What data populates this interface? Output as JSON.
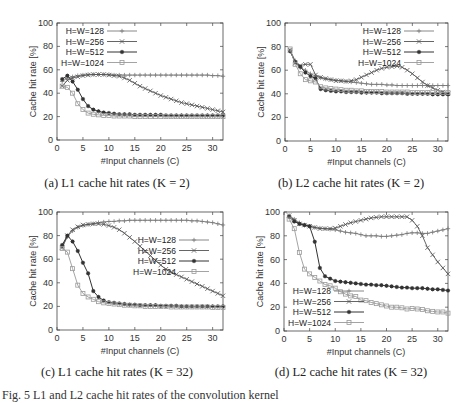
{
  "figure": {
    "bottom_caption": "Fig. 5 L1 and L2 cache hit rates of the convolution kernel"
  },
  "chart_data": [
    {
      "id": "a",
      "type": "line",
      "caption": "(a) L1 cache hit rates (K = 2)",
      "title": "",
      "xlabel": "#Input channels (C)",
      "ylabel": "Cache hit rate [%]",
      "xlim": [
        0,
        32
      ],
      "ylim": [
        0,
        100
      ],
      "xticks": [
        0,
        5,
        10,
        15,
        20,
        25,
        30
      ],
      "yticks": [
        0,
        20,
        40,
        60,
        80,
        100
      ],
      "legend_position": "top-left",
      "x": [
        1,
        2,
        3,
        4,
        5,
        6,
        7,
        8,
        9,
        10,
        11,
        12,
        13,
        14,
        15,
        16,
        17,
        18,
        19,
        20,
        21,
        22,
        23,
        24,
        25,
        26,
        27,
        28,
        29,
        30,
        31,
        32
      ],
      "series": [
        {
          "name": "H=W=128",
          "marker": "plus",
          "values": [
            50,
            53,
            54,
            55,
            55.5,
            56,
            56,
            56,
            56,
            56,
            55.5,
            55.5,
            55.5,
            55.5,
            55.5,
            55.5,
            55.5,
            55.5,
            55.5,
            55.5,
            55.5,
            55.5,
            55.5,
            55.5,
            55.5,
            55.5,
            55.5,
            55.5,
            55.5,
            55,
            55,
            54.5
          ]
        },
        {
          "name": "H=W=256",
          "marker": "x",
          "values": [
            46,
            51,
            53,
            54,
            55,
            55.5,
            56,
            56,
            56,
            55.5,
            55,
            54.5,
            53,
            51,
            48.5,
            46,
            44,
            42,
            40,
            38,
            36.5,
            35,
            33.5,
            32,
            31,
            30,
            29,
            28,
            27,
            26,
            25,
            24
          ]
        },
        {
          "name": "H=W=512",
          "marker": "star",
          "values": [
            52,
            55,
            50,
            43,
            35,
            29,
            26,
            24.5,
            23.5,
            23,
            22.5,
            22,
            22,
            22,
            21.5,
            21.5,
            21.5,
            21.5,
            21.5,
            21.5,
            21,
            21,
            21,
            21,
            21,
            21,
            21,
            21,
            21,
            21,
            21,
            21
          ]
        },
        {
          "name": "H=W=1024",
          "marker": "square",
          "values": [
            46,
            45,
            40,
            31,
            26,
            23,
            22,
            21.5,
            21,
            21,
            20.5,
            20.5,
            20.5,
            20.5,
            20,
            20,
            20,
            20,
            20,
            20,
            20,
            20,
            20,
            20,
            20,
            20,
            20,
            20,
            20,
            20,
            20,
            20
          ]
        }
      ]
    },
    {
      "id": "b",
      "type": "line",
      "caption": "(b) L2 cache hit rates (K = 2)",
      "title": "",
      "xlabel": "#Input channels (C)",
      "ylabel": "Cache hit rate [%]",
      "xlim": [
        0,
        32
      ],
      "ylim": [
        0,
        100
      ],
      "xticks": [
        0,
        5,
        10,
        15,
        20,
        25,
        30
      ],
      "yticks": [
        0,
        20,
        40,
        60,
        80,
        100
      ],
      "legend_position": "top-right",
      "x": [
        1,
        2,
        3,
        4,
        5,
        6,
        7,
        8,
        9,
        10,
        11,
        12,
        13,
        14,
        15,
        16,
        17,
        18,
        19,
        20,
        21,
        22,
        23,
        24,
        25,
        26,
        27,
        28,
        29,
        30,
        31,
        32
      ],
      "series": [
        {
          "name": "H=W=128",
          "marker": "plus",
          "values": [
            77,
            68,
            62,
            60,
            57,
            55,
            53.5,
            52.5,
            52,
            51.5,
            51,
            50.5,
            50,
            49.5,
            49,
            48.5,
            48,
            48,
            48,
            47.5,
            47.5,
            47,
            47,
            47,
            47,
            47,
            47,
            47,
            47,
            47,
            47,
            47
          ]
        },
        {
          "name": "H=W=256",
          "marker": "x",
          "values": [
            77,
            66,
            64,
            65,
            65,
            56,
            54,
            53,
            52,
            51,
            51,
            50.5,
            51,
            52,
            54,
            56,
            58,
            60,
            61.5,
            62.5,
            63,
            63.5,
            62.5,
            60,
            57,
            53.5,
            50,
            47,
            45,
            43,
            41.5,
            40
          ]
        },
        {
          "name": "H=W=512",
          "marker": "star",
          "values": [
            76,
            67,
            63,
            58,
            55,
            53,
            44,
            43,
            42.5,
            42,
            42,
            41.5,
            41.5,
            41.5,
            41,
            41,
            41,
            41,
            40.5,
            40.5,
            40.5,
            40.5,
            40.5,
            40,
            40,
            40,
            40,
            40,
            39.5,
            39.5,
            39.5,
            39.5
          ]
        },
        {
          "name": "H=W=1024",
          "marker": "square",
          "values": [
            78,
            65,
            57,
            52,
            51,
            50,
            46,
            45,
            44.5,
            44,
            43.5,
            43,
            43,
            42.5,
            42.5,
            42,
            42,
            42,
            42,
            41.5,
            41.5,
            41.5,
            41.5,
            41.5,
            41,
            41,
            41,
            41,
            41,
            41,
            41,
            41
          ]
        }
      ]
    },
    {
      "id": "c",
      "type": "line",
      "caption": "(c) L1 cache hit rates (K = 32)",
      "title": "",
      "xlabel": "#Input channels (C)",
      "ylabel": "Cache hit rate [%]",
      "xlim": [
        0,
        32
      ],
      "ylim": [
        0,
        100
      ],
      "xticks": [
        0,
        5,
        10,
        15,
        20,
        25,
        30
      ],
      "yticks": [
        0,
        20,
        40,
        60,
        80,
        100
      ],
      "legend_position": "right",
      "x": [
        1,
        2,
        3,
        4,
        5,
        6,
        7,
        8,
        9,
        10,
        11,
        12,
        13,
        14,
        15,
        16,
        17,
        18,
        19,
        20,
        21,
        22,
        23,
        24,
        25,
        26,
        27,
        28,
        29,
        30,
        31,
        32
      ],
      "series": [
        {
          "name": "H=W=128",
          "marker": "plus",
          "values": [
            70,
            79,
            84,
            87,
            88.5,
            89.5,
            90,
            91,
            91.5,
            92,
            92,
            92.5,
            92.5,
            93,
            93,
            93,
            93,
            93,
            93,
            93,
            93,
            93,
            93,
            93,
            93,
            92.5,
            92.5,
            92,
            91.5,
            91,
            90,
            89
          ]
        },
        {
          "name": "H=W=256",
          "marker": "x",
          "values": [
            70,
            80,
            85,
            87.5,
            89,
            89.5,
            90,
            90,
            89.5,
            88.5,
            87,
            85,
            82,
            78.5,
            75,
            71,
            67,
            63,
            59,
            55,
            51.5,
            49,
            47,
            45,
            43,
            41,
            39,
            37,
            35,
            33,
            31,
            29
          ]
        },
        {
          "name": "H=W=512",
          "marker": "star",
          "values": [
            72,
            80,
            75,
            67,
            57,
            48,
            33,
            28,
            25,
            23.5,
            23,
            22.5,
            22,
            21.5,
            21.5,
            21,
            21,
            21,
            21,
            20.5,
            20.5,
            20.5,
            20.5,
            20,
            20,
            20,
            20,
            20,
            20,
            20,
            20,
            20
          ]
        },
        {
          "name": "H=W=1024",
          "marker": "square",
          "values": [
            69,
            66,
            52,
            38,
            31,
            28,
            26,
            24,
            23,
            22.5,
            22,
            21.5,
            21,
            21,
            20.5,
            20.5,
            20,
            20,
            20,
            20,
            20,
            19.5,
            19.5,
            19.5,
            19.5,
            19.5,
            19.5,
            19.5,
            19.5,
            19,
            19,
            19
          ]
        }
      ]
    },
    {
      "id": "d",
      "type": "line",
      "caption": "(d) L2 cache hit rates (K = 32)",
      "title": "",
      "xlabel": "#Input channels (C)",
      "ylabel": "Cache hit rate [%]",
      "xlim": [
        0,
        32
      ],
      "ylim": [
        0,
        100
      ],
      "xticks": [
        0,
        5,
        10,
        15,
        20,
        25,
        30
      ],
      "yticks": [
        0,
        20,
        40,
        60,
        80,
        100
      ],
      "legend_position": "bottom-left",
      "x": [
        1,
        2,
        3,
        4,
        5,
        6,
        7,
        8,
        9,
        10,
        11,
        12,
        13,
        14,
        15,
        16,
        17,
        18,
        19,
        20,
        21,
        22,
        23,
        24,
        25,
        26,
        27,
        28,
        29,
        30,
        31,
        32
      ],
      "series": [
        {
          "name": "H=W=128",
          "marker": "plus",
          "values": [
            97,
            94,
            91,
            89,
            88,
            87,
            86.5,
            86,
            85.5,
            85,
            84,
            83,
            82.5,
            82,
            81,
            80,
            80,
            80,
            79.5,
            79.5,
            80,
            80.5,
            81,
            82,
            82.5,
            82.5,
            82,
            82,
            83,
            84,
            85,
            86
          ]
        },
        {
          "name": "H=W=256",
          "marker": "x",
          "values": [
            97,
            93,
            90,
            89,
            88,
            87,
            86,
            86,
            86,
            86.5,
            88,
            89.5,
            91,
            92,
            93,
            94,
            95,
            95.5,
            96,
            96,
            96,
            96,
            96,
            96,
            93,
            88,
            80,
            70,
            64,
            58,
            53,
            48
          ]
        },
        {
          "name": "H=W=512",
          "marker": "star",
          "values": [
            96,
            92,
            90,
            89,
            88,
            75,
            53,
            46,
            44,
            42,
            41.5,
            41,
            40.5,
            40,
            39.5,
            39,
            39,
            38.5,
            38.5,
            38,
            37.5,
            37,
            36.5,
            36.5,
            36,
            36,
            36,
            35.5,
            35,
            35,
            34.5,
            34
          ]
        },
        {
          "name": "H=W=1024",
          "marker": "square",
          "values": [
            94,
            86,
            66,
            52,
            48,
            45,
            42,
            39,
            38,
            36,
            33,
            31,
            29.5,
            29,
            26,
            25.5,
            24,
            23,
            22,
            21,
            20,
            20,
            19.5,
            18.5,
            19,
            18.5,
            18,
            17,
            16.5,
            16,
            16,
            15
          ]
        }
      ]
    }
  ]
}
